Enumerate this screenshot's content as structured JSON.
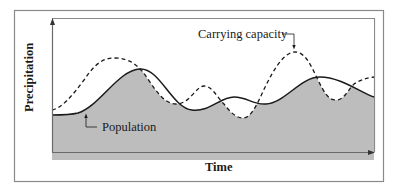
{
  "diagram": {
    "y_axis_label": "Precipitation",
    "x_axis_label": "Time",
    "annotations": {
      "carrying_capacity": "Carrying capacity",
      "population": "Population"
    },
    "series": [
      {
        "name": "Carrying capacity",
        "style": "dashed",
        "color": "#1a1a1a"
      },
      {
        "name": "Population",
        "style": "solid",
        "color": "#1a1a1a"
      }
    ],
    "shading": {
      "meaning": "population exceeds carrying capacity",
      "color": "#bdbdbd",
      "regions": 3
    },
    "colors": {
      "frame": "#8a8a8a",
      "axis": "#6a6a6a",
      "curve": "#1a1a1a",
      "fill": "#bdbdbd"
    }
  }
}
